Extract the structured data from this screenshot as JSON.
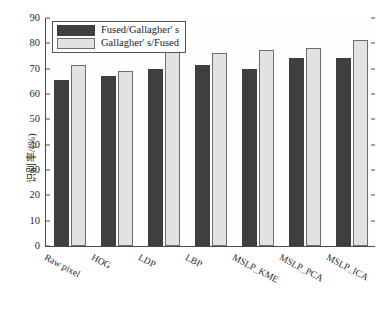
{
  "chart_data": {
    "type": "bar",
    "title": "",
    "xlabel": "",
    "ylabel": "识别率/(%)",
    "ylim": [
      0,
      90
    ],
    "ytick_step": 10,
    "yticks": [
      0,
      10,
      20,
      30,
      40,
      50,
      60,
      70,
      80,
      90
    ],
    "grid": false,
    "legend_position": "top-left",
    "categories": [
      "Raw pixel",
      "HOG",
      "LDP",
      "LBP",
      "MSLP_KME",
      "MSLP_PCA",
      "MSLP_ICA"
    ],
    "series": [
      {
        "name": "Fused/Gallagher' s",
        "color": "#3f3f3f",
        "values": [
          65.7,
          67.2,
          70.0,
          71.3,
          69.7,
          74.3,
          74.3
        ]
      },
      {
        "name": "Gallagher' s/Fused",
        "color": "#e2e2e2",
        "values": [
          71.6,
          69.2,
          77.8,
          76.0,
          77.2,
          78.0,
          81.2
        ]
      }
    ]
  },
  "legend": {
    "items": [
      {
        "label": "Fused/Gallagher' s"
      },
      {
        "label": "Gallagher' s/Fused"
      }
    ]
  },
  "axes": {
    "y_label": "识别率/(%)",
    "y_ticks": [
      "0",
      "10",
      "20",
      "30",
      "40",
      "50",
      "60",
      "70",
      "80",
      "90"
    ],
    "x_ticks": [
      "Raw pixel",
      "HOG",
      "LDP",
      "LBP",
      "MSLP_KME",
      "MSLP_PCA",
      "MSLP_ICA"
    ]
  },
  "colors": {
    "series_0": "#3f3f3f",
    "series_1": "#e2e2e2",
    "axis": "#4a4a4a",
    "background": "#ffffff",
    "text": "#2a2a2a"
  }
}
